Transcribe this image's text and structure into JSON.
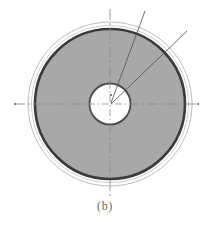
{
  "figure": {
    "caption": "(b)",
    "type": "technical-cross-section-diagram",
    "canvas": {
      "width": 210,
      "height": 227
    },
    "center": {
      "x": 110,
      "y": 104
    },
    "colors": {
      "background": "#ffffff",
      "disc_fill": "#a8a8a8",
      "thick_ring_stroke": "#3a3a3a",
      "outer_circle_stroke": "#b4b4b4",
      "inner_circle_stroke": "#4a4a4a",
      "inner_circle_fill": "#ffffff",
      "axis_stroke": "#8a8a8a",
      "leader_line_stroke": "#555555",
      "caption_color": "#6a6a6a"
    },
    "circles": [
      {
        "name": "outer-thin-circle",
        "radius": 82,
        "stroke_width": 0.9,
        "fill": "none"
      },
      {
        "name": "outer-shell-circle",
        "radius": 78.5,
        "stroke_width": 0.8,
        "fill": "#ffffff"
      },
      {
        "name": "thick-dark-ring",
        "radius": 75,
        "stroke_width": 2.6,
        "fill": "#a8a8a8"
      },
      {
        "name": "inner-bore-circle",
        "radius": 20.5,
        "stroke_width": 1.8,
        "fill": "#ffffff"
      }
    ],
    "axes": [
      {
        "name": "horizontal-centerline",
        "x1": 14,
        "y1": 104,
        "x2": 199,
        "y2": 104,
        "style": "dash-dot"
      },
      {
        "name": "vertical-centerline",
        "x1": 110,
        "y1": 9,
        "x2": 110,
        "y2": 198,
        "style": "dash-dot"
      }
    ],
    "axis_end_dots": [
      {
        "name": "left-axis-endpoint",
        "x": 15,
        "y": 104
      },
      {
        "name": "right-axis-endpoint",
        "x": 198,
        "y": 104
      }
    ],
    "leader_lines": [
      {
        "name": "leader-line-upper",
        "x1": 111,
        "y1": 103,
        "x2": 145,
        "y2": 11
      },
      {
        "name": "leader-line-lower",
        "x1": 111,
        "y1": 104,
        "x2": 187,
        "y2": 31
      }
    ],
    "center_mark": {
      "name": "center-point",
      "x": 111,
      "y": 95,
      "radius": 1.0
    }
  }
}
